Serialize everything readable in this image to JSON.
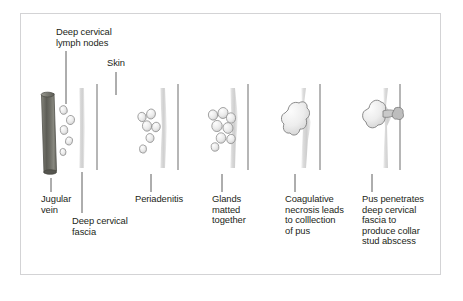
{
  "figure": {
    "frame_color": "#d3d3d5",
    "background_color": "#ffffff",
    "text_color": "#231f20",
    "vein_color": "#6d6d63",
    "fascia_color": "#d9d9d9",
    "skin_color": "#9a9a9a",
    "node_color": "#e8e8e8",
    "node_outline_color": "#8a8a8a"
  },
  "top_labels": [
    {
      "id": "deep-cervical-lymph-nodes",
      "text": "Deep cervical\nlymph nodes"
    },
    {
      "id": "skin",
      "text": "Skin"
    }
  ],
  "bottom_labels": [
    {
      "id": "jugular-vein",
      "text": "Jugular\nvein"
    },
    {
      "id": "deep-cervical-fascia",
      "text": "Deep cervical\nfascia"
    },
    {
      "id": "periadenitis",
      "text": "Periadenitis"
    },
    {
      "id": "glands-matted-together",
      "text": "Glands\nmatted\ntogether"
    },
    {
      "id": "coagulative-necrosis",
      "text": "Coagulative\nnecrosis leads\nto colllection\nof pus"
    },
    {
      "id": "pus-penetrates",
      "text": "Pus penetrates\ndeep cervical\nfascia to\nproduce collar\nstud abscess"
    }
  ],
  "stages": [
    {
      "id": "stage-1-normal",
      "label": "Jugular vein with discrete deep cervical lymph nodes"
    },
    {
      "id": "stage-2-periadenitis",
      "label": "Periadenitis"
    },
    {
      "id": "stage-3-matted",
      "label": "Glands matted together"
    },
    {
      "id": "stage-4-necrosis",
      "label": "Coagulative necrosis leads to colllection of pus"
    },
    {
      "id": "stage-5-penetration",
      "label": "Pus penetrates deep cervical fascia to produce collar stud abscess"
    }
  ]
}
